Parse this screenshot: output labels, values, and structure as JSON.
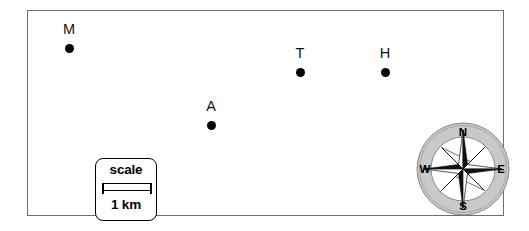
{
  "map": {
    "background_color": "#ffffff",
    "border_color": "#6e6e6e",
    "markers": [
      {
        "label": "M",
        "x": 41,
        "y": 37,
        "name": "marker-m"
      },
      {
        "label": "A",
        "x": 183,
        "y": 114,
        "name": "marker-a"
      },
      {
        "label": "T",
        "x": 272,
        "y": 61,
        "name": "marker-t"
      },
      {
        "label": "H",
        "x": 357,
        "y": 61,
        "name": "marker-h"
      }
    ],
    "marker_color": "#000000"
  },
  "scale": {
    "title": "scale",
    "value": "1 km",
    "bar_length_label": "1 km"
  },
  "compass": {
    "north": "N",
    "east": "E",
    "south": "S",
    "west": "W",
    "ring_color": "#c9c9c9",
    "ring_stroke": "#8a8a8a",
    "star_dark": "#111111",
    "star_light": "#ffffff"
  }
}
